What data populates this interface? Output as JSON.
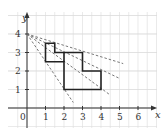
{
  "diagram": {
    "axes": {
      "x_label": "x",
      "y_label": "y",
      "x_ticks": [
        "0",
        "1",
        "2",
        "3",
        "4",
        "5",
        "6"
      ],
      "y_ticks": [
        "1",
        "2",
        "3",
        "4"
      ]
    },
    "grid": {
      "x_range": [
        -0.5,
        6.8
      ],
      "y_range": [
        -1,
        5.2
      ]
    },
    "shape": {
      "vertices": [
        [
          1,
          3.5
        ],
        [
          1.5,
          3.5
        ],
        [
          1.5,
          3
        ],
        [
          3,
          3
        ],
        [
          3,
          2
        ],
        [
          4,
          2
        ],
        [
          4,
          1
        ],
        [
          2,
          1
        ],
        [
          2,
          2.5
        ],
        [
          1,
          2.5
        ]
      ],
      "inner_segment": [
        [
          2,
          2.5
        ],
        [
          2,
          3
        ]
      ]
    },
    "rays_from": [
      0,
      4
    ],
    "rays_to": [
      [
        5.2,
        2.4
      ],
      [
        5,
        1.6
      ],
      [
        4.5,
        0.7
      ],
      [
        2.5,
        0.3
      ]
    ]
  },
  "chart_data": {
    "type": "diagram",
    "title": "",
    "xlabel": "x",
    "ylabel": "y",
    "x_ticks": [
      0,
      1,
      2,
      3,
      4,
      5,
      6
    ],
    "y_ticks": [
      1,
      2,
      3,
      4
    ],
    "polygon": [
      [
        1,
        3.5
      ],
      [
        1.5,
        3.5
      ],
      [
        1.5,
        3
      ],
      [
        3,
        3
      ],
      [
        3,
        2
      ],
      [
        4,
        2
      ],
      [
        4,
        1
      ],
      [
        2,
        1
      ],
      [
        2,
        2.5
      ],
      [
        1,
        2.5
      ]
    ],
    "dashed_lines_from": [
      0,
      4
    ],
    "dashed_lines_to": [
      [
        5.2,
        2.4
      ],
      [
        5,
        1.6
      ],
      [
        4.5,
        0.7
      ],
      [
        2.5,
        0.3
      ]
    ],
    "grid": true
  }
}
